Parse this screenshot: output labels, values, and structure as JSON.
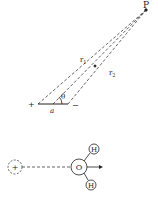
{
  "dipole_diagram": {
    "point_label": "P",
    "r1_label": "r",
    "r1_sub": "1",
    "r2_label": "r",
    "r2_sub": "2",
    "theta_label": "θ",
    "separation_label": "a",
    "plus_label": "+",
    "minus_label": "−"
  },
  "water_diagram": {
    "ion_label": "+",
    "oxygen_label": "O",
    "hydrogen_top_label": "H",
    "hydrogen_bottom_label": "H"
  },
  "colors": {
    "ink": "#222222",
    "background": "#ffffff"
  }
}
